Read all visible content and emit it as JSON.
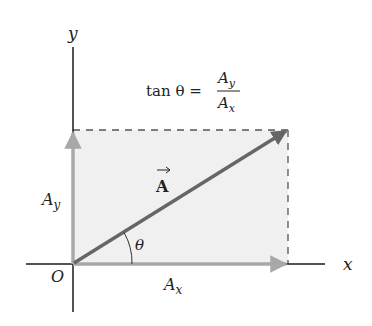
{
  "diagram": {
    "formula": {
      "lhs": "tan θ =",
      "numerator": "A",
      "numerator_sub": "y",
      "denominator": "A",
      "denominator_sub": "x"
    },
    "axes": {
      "x_label": "x",
      "y_label": "y",
      "origin_label": "O"
    },
    "vector": {
      "label": "A",
      "angle_label": "θ"
    },
    "components": {
      "ax_label": "A",
      "ax_sub": "x",
      "ay_label": "A",
      "ay_sub": "y"
    },
    "colors": {
      "axis": "#1a1a1a",
      "vector": "#666666",
      "component": "#a8a8a8",
      "fill": "#f0f0f0",
      "dash": "#555555"
    }
  }
}
